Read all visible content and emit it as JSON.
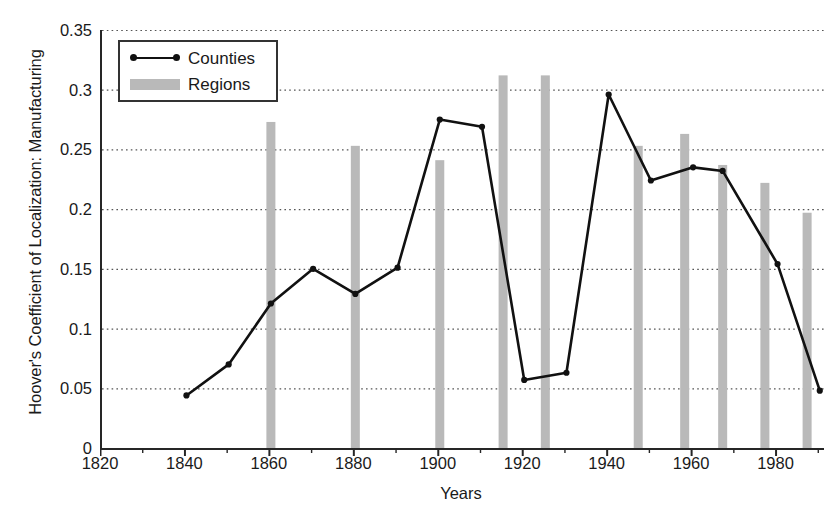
{
  "chart_data": {
    "type": "line",
    "title": "",
    "xlabel": "Years",
    "ylabel": "Hoover's Coefficient of Localization: Manufacturing",
    "xlim": [
      1820,
      1991
    ],
    "ylim": [
      0,
      0.35
    ],
    "grid": "horizontal-dotted",
    "legend_position": "top-left-inside",
    "y_ticks": [
      "0",
      "0.05",
      "0.1",
      "0.15",
      "0.2",
      "0.25",
      "0.3",
      "0.35"
    ],
    "y_tick_values": [
      0,
      0.05,
      0.1,
      0.15,
      0.2,
      0.25,
      0.3,
      0.35
    ],
    "x_ticks": [
      "1820",
      "1840",
      "1860",
      "1880",
      "1900",
      "1920",
      "1940",
      "1960",
      "1980"
    ],
    "x_tick_values": [
      1820,
      1840,
      1860,
      1880,
      1900,
      1920,
      1940,
      1960,
      1980
    ],
    "x_minor_step": 10,
    "series": [
      {
        "name": "Counties",
        "type": "line",
        "color": "#111111",
        "marker": "circle",
        "x": [
          1840,
          1850,
          1860,
          1870,
          1880,
          1890,
          1900,
          1910,
          1920,
          1930,
          1940,
          1950,
          1960,
          1967,
          1980,
          1990
        ],
        "values": [
          0.044,
          0.07,
          0.121,
          0.15,
          0.129,
          0.151,
          0.275,
          0.269,
          0.057,
          0.063,
          0.296,
          0.224,
          0.235,
          0.232,
          0.154,
          0.048
        ]
      },
      {
        "name": "Regions",
        "type": "bar",
        "color": "#b9b9b9",
        "x": [
          1860,
          1880,
          1900,
          1915,
          1925,
          1947,
          1958,
          1967,
          1977,
          1987
        ],
        "values": [
          0.273,
          0.253,
          0.241,
          0.312,
          0.312,
          0.253,
          0.263,
          0.237,
          0.222,
          0.197
        ]
      }
    ]
  },
  "legend": {
    "items": [
      {
        "label": "Counties",
        "marker": "line-with-dots"
      },
      {
        "label": "Regions",
        "marker": "gray-bar"
      }
    ]
  }
}
